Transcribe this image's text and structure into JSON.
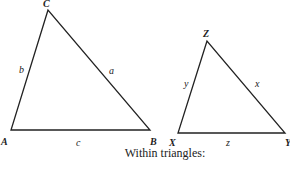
{
  "triangle1": {
    "vertices": {
      "A": "A",
      "B": "B",
      "C": "C"
    },
    "sides": {
      "a": "a",
      "b": "b",
      "c": "c"
    }
  },
  "triangle2": {
    "vertices": {
      "X": "X",
      "Y": "Y",
      "Z": "Z"
    },
    "sides": {
      "x": "x",
      "y": "y",
      "z": "z"
    }
  },
  "caption": "Within triangles:",
  "colors": {
    "stroke": "#222222",
    "background": "#ffffff"
  }
}
